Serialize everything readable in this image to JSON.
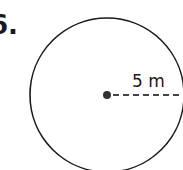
{
  "problem": {
    "number_label": "6."
  },
  "figure": {
    "shape": "circle",
    "radius_label": "5 m",
    "radius_value": 5,
    "radius_unit": "m",
    "colors": {
      "stroke": "#1a1a1a",
      "dash": "#444444",
      "background": "#ffffff"
    }
  }
}
